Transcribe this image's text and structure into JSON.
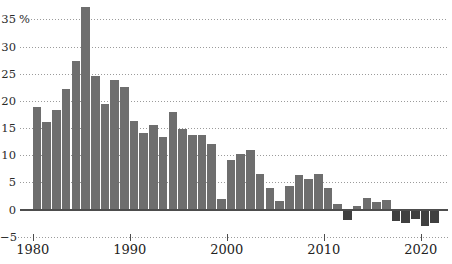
{
  "chart_data": {
    "type": "bar",
    "title": "",
    "unit_suffix": " %",
    "grid": "horizontal-dotted",
    "legend": "none",
    "ylim": [
      -5,
      38.5
    ],
    "y_ticks": [
      35,
      30,
      25,
      20,
      15,
      10,
      5,
      0,
      -5
    ],
    "y_tick_labels": [
      "35",
      "30",
      "25",
      "20",
      "15",
      "10",
      "5",
      "0",
      "−5"
    ],
    "x_ticks": [
      1980,
      1990,
      2000,
      2010,
      2020
    ],
    "x_tick_labels": [
      "1980",
      "1990",
      "2000",
      "2010",
      "2020"
    ],
    "categories": [
      1980,
      1981,
      1982,
      1983,
      1984,
      1985,
      1986,
      1987,
      1988,
      1989,
      1990,
      1991,
      1992,
      1993,
      1994,
      1995,
      1996,
      1997,
      1998,
      1999,
      2000,
      2001,
      2002,
      2003,
      2004,
      2005,
      2006,
      2007,
      2008,
      2009,
      2010,
      2011,
      2012,
      2013,
      2014,
      2015,
      2016,
      2017,
      2018,
      2019,
      2020,
      2021
    ],
    "values": [
      18.8,
      16.2,
      18.4,
      22.1,
      27.3,
      37.3,
      24.6,
      19.4,
      23.9,
      22.6,
      16.3,
      14.1,
      15.5,
      13.3,
      17.9,
      14.9,
      13.8,
      13.8,
      12.0,
      2.0,
      9.1,
      10.3,
      10.9,
      6.5,
      3.9,
      1.5,
      4.3,
      6.4,
      5.7,
      6.5,
      3.9,
      1.1,
      -1.7,
      0.7,
      2.2,
      1.4,
      1.8,
      -2.0,
      -2.3,
      -1.5,
      -2.8,
      -2.3
    ],
    "colors": {
      "bar_positive": "#6e6e6e",
      "bar_negative": "#3f3f3f",
      "gridline": "#9b9b9b",
      "zero_line": "#4d4d4d",
      "text": "#2a2a2a",
      "background": "#ffffff"
    }
  }
}
